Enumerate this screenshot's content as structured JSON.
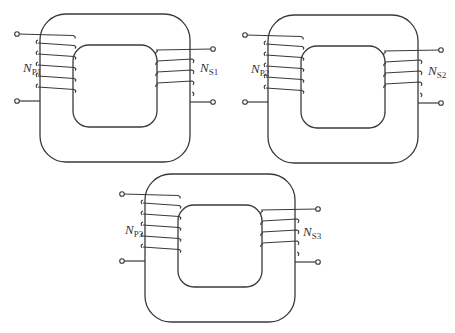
{
  "figure": {
    "line_color": "#3a3a3a",
    "background": "#ffffff"
  },
  "transformers": [
    {
      "id": "T1",
      "primary_label": "N",
      "primary_sub": "P1",
      "secondary_label": "N",
      "secondary_sub": "S1",
      "primary_turns": 5,
      "secondary_turns": 4,
      "position": "top-left"
    },
    {
      "id": "T2",
      "primary_label": "N",
      "primary_sub": "P2",
      "secondary_label": "N",
      "secondary_sub": "S2",
      "primary_turns": 5,
      "secondary_turns": 4,
      "position": "top-right"
    },
    {
      "id": "T3",
      "primary_label": "N",
      "primary_sub": "P3",
      "secondary_label": "N",
      "secondary_sub": "S3",
      "primary_turns": 5,
      "secondary_turns": 4,
      "position": "bottom-center"
    }
  ]
}
